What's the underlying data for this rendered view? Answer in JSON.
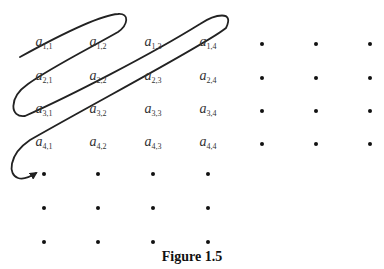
{
  "figure": {
    "caption": "Figure 1.5",
    "labels": [
      {
        "id": "a11",
        "base": "a",
        "sub": "1,1",
        "row": 1,
        "col": 1
      },
      {
        "id": "a12",
        "base": "a",
        "sub": "1,2",
        "row": 1,
        "col": 2
      },
      {
        "id": "a13",
        "base": "a",
        "sub": "1,3",
        "row": 1,
        "col": 3
      },
      {
        "id": "a14",
        "base": "a",
        "sub": "1,4",
        "row": 1,
        "col": 4
      },
      {
        "id": "a21",
        "base": "a",
        "sub": "2,1",
        "row": 2,
        "col": 1
      },
      {
        "id": "a22",
        "base": "a",
        "sub": "2,2",
        "row": 2,
        "col": 2
      },
      {
        "id": "a23",
        "base": "a",
        "sub": "2,3",
        "row": 2,
        "col": 3
      },
      {
        "id": "a24",
        "base": "a",
        "sub": "2,4",
        "row": 2,
        "col": 4
      },
      {
        "id": "a31",
        "base": "a",
        "sub": "3,1",
        "row": 3,
        "col": 1
      },
      {
        "id": "a32",
        "base": "a",
        "sub": "3,2",
        "row": 3,
        "col": 2
      },
      {
        "id": "a33",
        "base": "a",
        "sub": "3,3",
        "row": 3,
        "col": 3
      },
      {
        "id": "a34",
        "base": "a",
        "sub": "3,4",
        "row": 3,
        "col": 4
      },
      {
        "id": "a41",
        "base": "a",
        "sub": "4,1",
        "row": 4,
        "col": 1
      },
      {
        "id": "a42",
        "base": "a",
        "sub": "4,2",
        "row": 4,
        "col": 2
      },
      {
        "id": "a43",
        "base": "a",
        "sub": "4,3",
        "row": 4,
        "col": 3
      },
      {
        "id": "a44",
        "base": "a",
        "sub": "4,4",
        "row": 4,
        "col": 4
      }
    ],
    "ellipsis_dots": {
      "right_columns": [
        5,
        6,
        7
      ],
      "right_rows": [
        1,
        2,
        3,
        4
      ],
      "bottom_rows": [
        5,
        6,
        7
      ],
      "bottom_columns": [
        1,
        2,
        3,
        4
      ]
    },
    "colors": {
      "path": "#222222",
      "text": "#333333",
      "dot": "#111111"
    }
  }
}
